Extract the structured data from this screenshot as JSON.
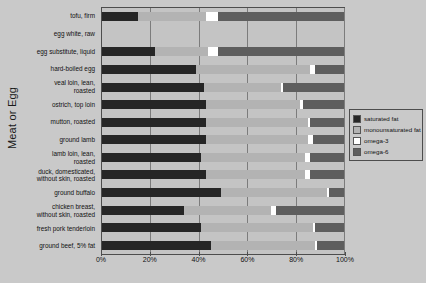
{
  "chart_data": {
    "type": "bar",
    "title": "",
    "subtitle": "",
    "xlabel": "",
    "ylabel": "Meat or Egg",
    "orientation": "horizontal",
    "stacked": true,
    "stack_mode": "percent",
    "xlim": [
      0,
      100
    ],
    "grid": true,
    "legend_position": "right",
    "xtick_labels": [
      "0%",
      "20%",
      "40%",
      "60%",
      "80%",
      "100%"
    ],
    "xtick_values": [
      0,
      20,
      40,
      60,
      80,
      100
    ],
    "categories": [
      "tofu, firm",
      "egg white, raw",
      "egg substitute, liquid",
      "hard-boiled egg",
      "veal loin, lean,\nroasted",
      "ostrich, top loin",
      "mutton, roasted",
      "ground lamb",
      "lamb loin, lean,\nroasted",
      "duck, domesticated,\nwithout skin, roasted",
      "ground buffalo",
      "chicken breast,\nwithout skin, roasted",
      "fresh pork tenderloin",
      "ground beef, 5% fat"
    ],
    "series": [
      {
        "name": "saturated fat",
        "color": "#262626",
        "values": [
          15,
          0,
          22,
          39,
          42,
          43,
          43,
          43,
          41,
          43,
          49,
          34,
          41,
          45
        ]
      },
      {
        "name": "monounsaturated fat",
        "color": "#b3b3b3",
        "values": [
          28,
          0,
          22,
          47,
          32,
          39,
          42,
          42,
          43,
          41,
          44,
          36,
          46,
          43
        ]
      },
      {
        "name": "omega-3",
        "color": "#ffffff",
        "values": [
          5,
          0,
          4,
          2,
          1,
          1,
          1,
          2,
          2,
          2,
          1,
          2,
          1,
          1
        ]
      },
      {
        "name": "omega-6",
        "color": "#5e5e5e",
        "values": [
          52,
          0,
          52,
          12,
          25,
          17,
          14,
          13,
          14,
          14,
          6,
          28,
          12,
          11
        ]
      }
    ]
  },
  "legend": {
    "items": [
      {
        "label": "saturated fat",
        "color": "#262626"
      },
      {
        "label": "monounsaturated fat",
        "color": "#b3b3b3"
      },
      {
        "label": "omega-3",
        "color": "#ffffff"
      },
      {
        "label": "omega-6",
        "color": "#5e5e5e"
      }
    ]
  }
}
